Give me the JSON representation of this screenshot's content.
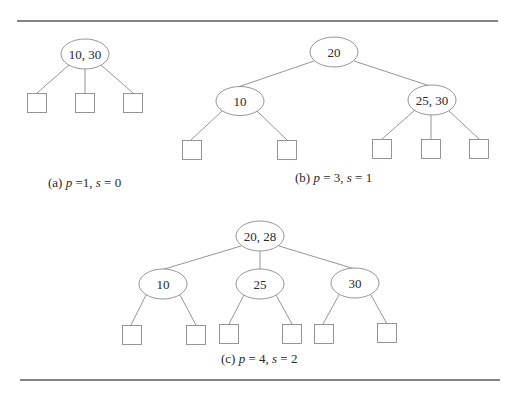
{
  "figure": {
    "trees": [
      {
        "id": "a",
        "caption": {
          "prefix": "(a) ",
          "p_var": "p",
          "p_eq": " =1, ",
          "s_var": "s",
          "s_eq": " = 0"
        },
        "root": {
          "keys": "10, 30",
          "children": [
            "leaf",
            "leaf",
            "leaf"
          ]
        }
      },
      {
        "id": "b",
        "caption": {
          "prefix": "(b) ",
          "p_var": "p",
          "p_eq": " = 3, ",
          "s_var": "s",
          "s_eq": " = 1"
        },
        "root": {
          "keys": "20",
          "children": [
            {
              "keys": "10",
              "children": [
                "leaf",
                "leaf"
              ]
            },
            {
              "keys": "25, 30",
              "children": [
                "leaf",
                "leaf",
                "leaf"
              ]
            }
          ]
        }
      },
      {
        "id": "c",
        "caption": {
          "prefix": "(c) ",
          "p_var": "p",
          "p_eq": " = 4, ",
          "s_var": "s",
          "s_eq": " = 2"
        },
        "root": {
          "keys": "20, 28",
          "children": [
            {
              "keys": "10",
              "children": [
                "leaf",
                "leaf"
              ]
            },
            {
              "keys": "25",
              "children": [
                "leaf",
                "leaf"
              ]
            },
            {
              "keys": "30",
              "children": [
                "leaf",
                "leaf"
              ]
            }
          ]
        }
      }
    ]
  }
}
